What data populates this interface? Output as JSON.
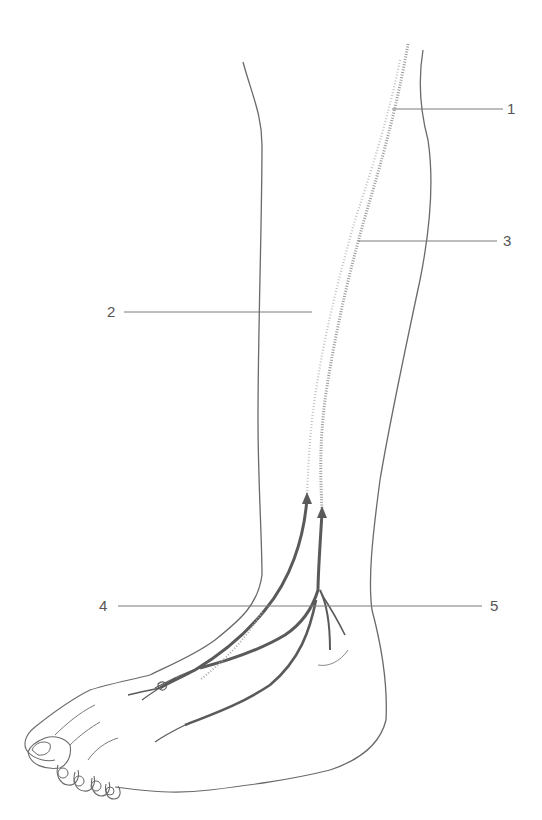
{
  "diagram": {
    "colors": {
      "outline": "#6a6a6a",
      "leader_line": "#7a7a7a",
      "nerve_dark": "#5a5a5a",
      "nerve_dotted": "#9a9a9a",
      "label_text": "#555555"
    },
    "labels": [
      {
        "id": "1",
        "text": "1",
        "x": 507,
        "y": 103
      },
      {
        "id": "2",
        "text": "2",
        "x": 107,
        "y": 305
      },
      {
        "id": "3",
        "text": "3",
        "x": 503,
        "y": 235
      },
      {
        "id": "4",
        "text": "4",
        "x": 99,
        "y": 597
      },
      {
        "id": "5",
        "text": "5",
        "x": 490,
        "y": 597
      }
    ]
  }
}
